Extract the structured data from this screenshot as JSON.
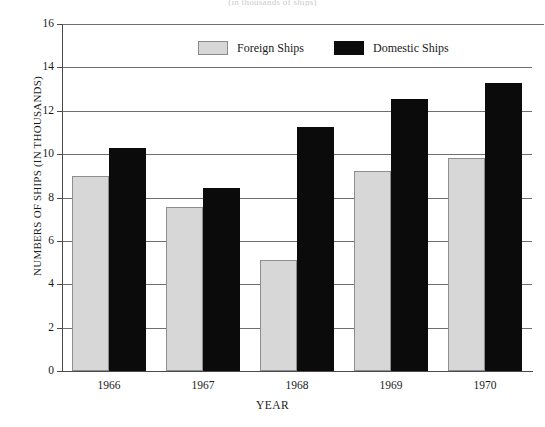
{
  "chart_data": {
    "type": "bar",
    "title": "(in thousands of ships)",
    "xlabel": "YEAR",
    "ylabel": "NUMBERS OF SHIPS (IN THOUSANDS)",
    "categories": [
      "1966",
      "1967",
      "1968",
      "1969",
      "1970"
    ],
    "series": [
      {
        "name": "Foreign Ships",
        "color": "#d7d7d7",
        "values": [
          9.0,
          7.55,
          5.1,
          9.2,
          9.8
        ]
      },
      {
        "name": "Domestic Ships",
        "color": "#0b0b0b",
        "values": [
          10.3,
          8.45,
          11.25,
          12.55,
          13.3
        ]
      }
    ],
    "ylim": [
      0,
      16
    ],
    "ytick_labels": [
      "16",
      "14",
      "12",
      "10",
      "8",
      "6",
      "4",
      "2",
      "0"
    ],
    "ytick_values": [
      16,
      14,
      12,
      10,
      8,
      6,
      4,
      2,
      0
    ],
    "grid": true,
    "legend_position": "top-center"
  },
  "legend": {
    "items": [
      {
        "label": "Foreign Ships",
        "swatch": "foreign"
      },
      {
        "label": "Domestic Ships",
        "swatch": "domestic"
      }
    ]
  }
}
